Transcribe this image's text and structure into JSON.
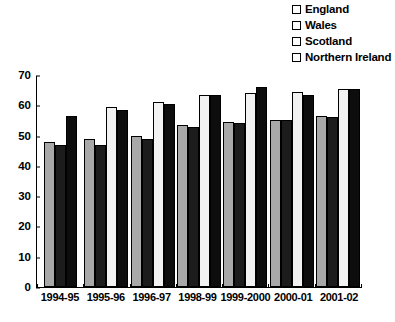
{
  "chart_data": {
    "type": "bar",
    "title": "",
    "xlabel": "",
    "ylabel": "",
    "ylim": [
      0,
      70
    ],
    "ytick_step": 10,
    "yticks": [
      0,
      10,
      20,
      30,
      40,
      50,
      60,
      70
    ],
    "grid": false,
    "legend_position": "top-right",
    "categories": [
      "1994-95",
      "1995-96",
      "1996-97",
      "1998-99",
      "1999-2000",
      "2000-01",
      "2001-02"
    ],
    "series": [
      {
        "name": "England",
        "color": "#a8a8a8",
        "values": [
          48,
          49,
          50,
          53.5,
          54.5,
          55,
          56.5
        ]
      },
      {
        "name": "Wales",
        "color": "#1c1c1c",
        "values": [
          47,
          47,
          49,
          53,
          54,
          55,
          56
        ]
      },
      {
        "name": "Scotland",
        "color": "#f2f2f2",
        "values": [
          null,
          59.5,
          61,
          63.5,
          64,
          64.5,
          65.5
        ]
      },
      {
        "name": "Northern Ireland",
        "color": "#0d0d0d",
        "values": [
          56.5,
          58.5,
          60.5,
          63.5,
          66,
          63.5,
          65.5
        ]
      }
    ]
  },
  "legend": {
    "items": [
      {
        "label": "England",
        "swatch": "legend-swatch-england"
      },
      {
        "label": "Wales",
        "swatch": "legend-swatch-wales"
      },
      {
        "label": "Scotland",
        "swatch": "legend-swatch-scotland"
      },
      {
        "label": "Northern Ireland",
        "swatch": "legend-swatch-northern-ireland"
      }
    ]
  },
  "footnote": {
    "text": ""
  }
}
